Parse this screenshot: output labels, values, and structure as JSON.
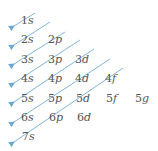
{
  "diagram": {
    "title": "",
    "colors": {
      "arrow": "#7fb6dc",
      "text": "#555555"
    },
    "rows": [
      {
        "n": "1",
        "orbitals": [
          "s"
        ]
      },
      {
        "n": "2",
        "orbitals": [
          "s",
          "p"
        ]
      },
      {
        "n": "3",
        "orbitals": [
          "s",
          "p",
          "d"
        ]
      },
      {
        "n": "4",
        "orbitals": [
          "s",
          "p",
          "d",
          "f"
        ]
      },
      {
        "n": "5",
        "orbitals": [
          "s",
          "p",
          "d",
          "f",
          "g"
        ]
      },
      {
        "n": "6",
        "orbitals": [
          "s",
          "p",
          "d"
        ]
      },
      {
        "n": "7",
        "orbitals": [
          "s"
        ]
      }
    ],
    "labels": {
      "r1": [
        "1",
        "s"
      ],
      "r2": [
        [
          "2",
          "s"
        ],
        [
          "2",
          "p"
        ]
      ],
      "r3": [
        [
          "3",
          "s"
        ],
        [
          "3",
          "p"
        ],
        [
          "3",
          "d"
        ]
      ],
      "r4": [
        [
          "4",
          "s"
        ],
        [
          "4",
          "p"
        ],
        [
          "4",
          "d"
        ],
        [
          "4",
          "f"
        ]
      ],
      "r5": [
        [
          "5",
          "s"
        ],
        [
          "5",
          "p"
        ],
        [
          "5",
          "d"
        ],
        [
          "5",
          "f"
        ],
        [
          "5",
          "g"
        ]
      ],
      "r6": [
        [
          "6",
          "s"
        ],
        [
          "6",
          "p"
        ],
        [
          "6",
          "d"
        ]
      ],
      "r7": [
        [
          "7",
          "s"
        ]
      ]
    },
    "arrow_count": 7,
    "fill_order": [
      "1s",
      "2s",
      "2p",
      "3s",
      "3p",
      "4s",
      "3d",
      "4p",
      "5s",
      "4d",
      "5p",
      "6s",
      "4f",
      "5d",
      "6p",
      "7s",
      "5f",
      "6d",
      "5g"
    ]
  }
}
